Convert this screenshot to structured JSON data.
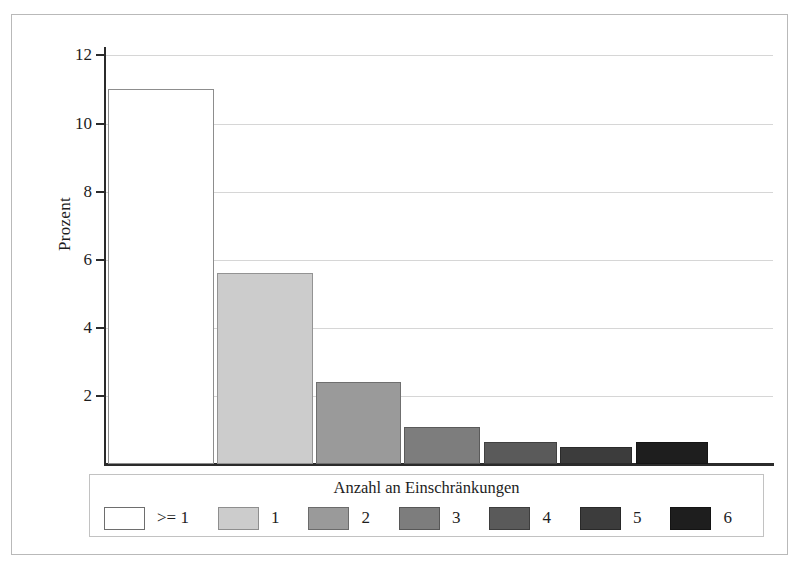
{
  "chart_data": {
    "type": "bar",
    "title": "",
    "xlabel": "",
    "ylabel": "Prozent",
    "ylim": [
      0,
      12.8
    ],
    "grid": true,
    "legend_position": "bottom",
    "legend_title": "Anzahl an Einschränkungen",
    "categories": [
      ">= 1",
      "1",
      "2",
      "3",
      "4",
      "5",
      "6"
    ],
    "values": [
      11.0,
      5.6,
      2.4,
      1.1,
      0.65,
      0.5,
      0.65
    ],
    "ytick_labels": [
      "2",
      "4",
      "6",
      "8",
      "10",
      "12"
    ],
    "ytick_values": [
      2,
      4,
      6,
      8,
      10,
      12
    ],
    "series": [
      {
        "name": "Anzahl an Einschränkungen",
        "values": [
          11.0,
          5.6,
          2.4,
          1.1,
          0.65,
          0.5,
          0.65
        ]
      }
    ],
    "bars": [
      {
        "label": ">= 1",
        "value": 11.0,
        "color": "#ffffff"
      },
      {
        "label": "1",
        "value": 5.6,
        "color": "#cccccc"
      },
      {
        "label": "2",
        "value": 2.4,
        "color": "#9a9a9a"
      },
      {
        "label": "3",
        "value": 1.1,
        "color": "#7d7d7d"
      },
      {
        "label": "4",
        "value": 0.65,
        "color": "#5a5a5a"
      },
      {
        "label": "5",
        "value": 0.5,
        "color": "#3c3c3c"
      },
      {
        "label": "6",
        "value": 0.65,
        "color": "#1e1e1e"
      }
    ]
  },
  "axes": {
    "y_title": "Prozent",
    "y_ticks": [
      {
        "label": "12",
        "value": 12
      },
      {
        "label": "10",
        "value": 10
      },
      {
        "label": "8",
        "value": 8
      },
      {
        "label": "6",
        "value": 6
      },
      {
        "label": "4",
        "value": 4
      },
      {
        "label": "2",
        "value": 2
      }
    ]
  },
  "legend": {
    "title": "Anzahl an Einschränkungen",
    "items": [
      {
        "label": ">= 1",
        "color": "#ffffff"
      },
      {
        "label": "1",
        "color": "#cccccc"
      },
      {
        "label": "2",
        "color": "#9a9a9a"
      },
      {
        "label": "3",
        "color": "#7d7d7d"
      },
      {
        "label": "4",
        "color": "#5a5a5a"
      },
      {
        "label": "5",
        "color": "#3c3c3c"
      },
      {
        "label": "6",
        "color": "#1e1e1e"
      }
    ]
  },
  "colors": {
    "axis": "#2b2b2b",
    "grid": "#d6d6d6",
    "frame": "#b9b9b9",
    "text": "#1d1d1d",
    "background": "#ffffff"
  }
}
